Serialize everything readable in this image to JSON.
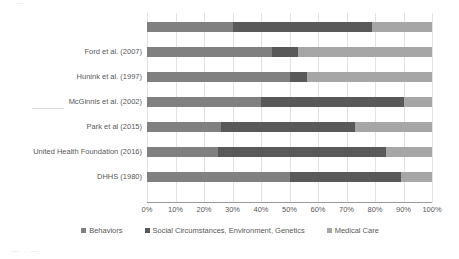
{
  "chart_data": {
    "type": "bar",
    "orientation": "horizontal",
    "stacked": true,
    "normalized_percent": true,
    "title": "",
    "xlabel": "",
    "ylabel": "",
    "xlim": [
      0,
      100
    ],
    "grid": true,
    "legend_position": "bottom",
    "categories": [
      "",
      "Ford et al. (2007)",
      "Hunink et al. (1997)",
      "McGinnis et al. (2002)",
      "Park et al (2015)",
      "United Health Foundation (2016)",
      "DHHS (1980)"
    ],
    "series": [
      {
        "name": "Behaviors",
        "color": "#808080",
        "values": [
          30,
          44,
          50,
          40,
          26,
          25,
          50
        ]
      },
      {
        "name": "Social Circumstances, Environment, Genetics",
        "color": "#595959",
        "values": [
          49,
          9,
          6,
          50,
          47,
          59,
          39
        ]
      },
      {
        "name": "Medical Care",
        "color": "#a6a6a6",
        "values": [
          21,
          47,
          44,
          10,
          27,
          16,
          11
        ]
      }
    ],
    "xticks": [
      {
        "value": 0,
        "label": "0%"
      },
      {
        "value": 10,
        "label": "10%"
      },
      {
        "value": 20,
        "label": "20%"
      },
      {
        "value": 30,
        "label": "30%"
      },
      {
        "value": 40,
        "label": "40%"
      },
      {
        "value": 50,
        "label": "50%"
      },
      {
        "value": 60,
        "label": "60%"
      },
      {
        "value": 70,
        "label": "70%"
      },
      {
        "value": 80,
        "label": "80%"
      },
      {
        "value": 90,
        "label": "90%"
      },
      {
        "value": 100,
        "label": "100%"
      }
    ]
  },
  "colors": {
    "behaviors": "#808080",
    "social_circumstances": "#595959",
    "medical_care": "#a6a6a6",
    "gridline": "#e2e2e2",
    "axis": "#9a9a9a",
    "text": "#595959"
  }
}
